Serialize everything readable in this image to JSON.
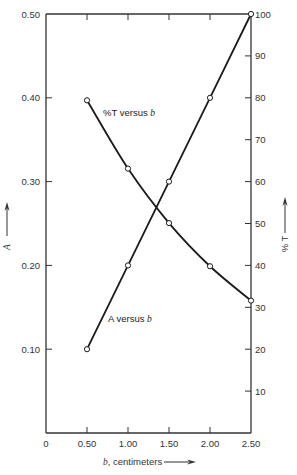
{
  "chart_data": {
    "type": "line",
    "title": "",
    "xlabel": "b, centimeters",
    "ylabel_left": "A",
    "ylabel_right": "% T",
    "x_ticks": [
      "0",
      "0.50",
      "1.00",
      "1.50",
      "2.00",
      "2.50"
    ],
    "x_tick_values": [
      0,
      0.5,
      1.0,
      1.5,
      2.0,
      2.5
    ],
    "y_left_ticks": [
      "0.10",
      "0.20",
      "0.30",
      "0.40",
      "0.50"
    ],
    "y_left_tick_values": [
      0.1,
      0.2,
      0.3,
      0.4,
      0.5
    ],
    "y_right_ticks": [
      "10",
      "20",
      "30",
      "40",
      "50",
      "60",
      "70",
      "80",
      "90",
      "100"
    ],
    "y_right_tick_values": [
      10,
      20,
      30,
      40,
      50,
      60,
      70,
      80,
      90,
      100
    ],
    "xlim": [
      0,
      2.5
    ],
    "ylim_left": [
      0,
      0.5
    ],
    "ylim_right": [
      0,
      100
    ],
    "grid": false,
    "x": [
      0.5,
      1.0,
      1.5,
      2.0,
      2.5
    ],
    "series": [
      {
        "name": "A versus b",
        "axis": "left",
        "label_text": "A versus",
        "label_var": "b",
        "values": [
          0.1,
          0.2,
          0.3,
          0.4,
          0.5
        ]
      },
      {
        "name": "%T versus b",
        "axis": "right",
        "label_text": "%T versus",
        "label_var": "b",
        "values": [
          79.4,
          63.1,
          50.1,
          39.8,
          31.6
        ]
      }
    ],
    "colors": {
      "line": "#1a1a1a",
      "axis": "#333333",
      "marker_fill": "#ffffff"
    }
  },
  "labels": {
    "x_axis_var": "b",
    "x_axis_unit": ", centimeters",
    "y_left": "A",
    "y_right": "% T"
  }
}
